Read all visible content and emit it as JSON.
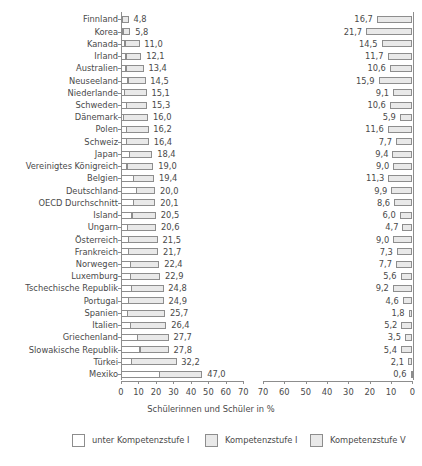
{
  "chart_data": {
    "type": "bar",
    "title": "",
    "subtitle": "",
    "xlabel": "Schülerinnen und Schüler in %",
    "ylabel": "",
    "orientation": "horizontal",
    "panels": [
      {
        "name": "left",
        "direction": "ltr",
        "axis_range": [
          0,
          70
        ],
        "ticks": [
          0,
          10,
          20,
          30,
          40,
          50,
          60,
          70
        ],
        "stacked": true,
        "series_names": [
          "unter Kompetenzstufe I",
          "Kompetenzstufe I"
        ]
      },
      {
        "name": "right",
        "direction": "rtl",
        "axis_range": [
          0,
          70
        ],
        "ticks": [
          70,
          60,
          50,
          40,
          30,
          20,
          10,
          0
        ],
        "stacked": false,
        "series_names": [
          "Kompetenzstufe V"
        ]
      }
    ],
    "grid": false,
    "legend_position": "bottom",
    "categories": [
      "Finnland",
      "Korea",
      "Kanada",
      "Irland",
      "Australien",
      "Neuseeland",
      "Niederlande",
      "Schweden",
      "Dänemark",
      "Polen",
      "Schweiz",
      "Japan",
      "Vereinigtes Königreich",
      "Belgien",
      "Deutschland",
      "OECD Durchschnitt",
      "Island",
      "Ungarn",
      "Österreich",
      "Frankreich",
      "Norwegen",
      "Luxemburg",
      "Tschechische Republik",
      "Portugal",
      "Spanien",
      "Italien",
      "Griechenland",
      "Slowakische Republik",
      "Türkei",
      "Mexiko"
    ],
    "series": [
      {
        "name": "unter Kompetenzstufe I",
        "values": [
          1.1,
          1.4,
          2.5,
          3.1,
          3.0,
          4.2,
          2.1,
          3.3,
          1.6,
          3.5,
          3.5,
          5.2,
          3.6,
          7.3,
          9.2,
          7.5,
          6.5,
          3.8,
          4.6,
          4.5,
          5.5,
          5.5,
          6.2,
          4.5,
          4.1,
          5.5,
          9.7,
          11.1,
          6.2,
          22.1
        ]
      },
      {
        "name": "Kompetenzstufe I",
        "values": [
          3.7,
          4.4,
          8.5,
          9.0,
          10.4,
          10.3,
          13.0,
          12.0,
          14.4,
          12.7,
          12.9,
          13.2,
          15.4,
          12.1,
          10.8,
          12.6,
          14.0,
          16.8,
          16.9,
          17.2,
          16.9,
          17.4,
          18.6,
          20.4,
          21.6,
          20.9,
          18.0,
          16.7,
          26.0,
          24.9
        ]
      }
    ],
    "left_totals": [
      4.8,
      5.8,
      11.0,
      12.1,
      13.4,
      14.5,
      15.1,
      15.3,
      16.0,
      16.2,
      16.4,
      18.4,
      19.0,
      19.4,
      20.0,
      20.1,
      20.5,
      20.6,
      21.5,
      21.7,
      22.4,
      22.9,
      24.8,
      24.9,
      25.7,
      26.4,
      27.7,
      27.8,
      32.2,
      47.0
    ],
    "left_total_labels": [
      "4,8",
      "5,8",
      "11,0",
      "12,1",
      "13,4",
      "14,5",
      "15,1",
      "15,3",
      "16,0",
      "16,2",
      "16,4",
      "18,4",
      "19,0",
      "19,4",
      "20,0",
      "20,1",
      "20,5",
      "20,6",
      "21,5",
      "21,7",
      "22,4",
      "22,9",
      "24,8",
      "24,9",
      "25,7",
      "26,4",
      "27,7",
      "27,8",
      "32,2",
      "47,0"
    ],
    "right_values": [
      16.7,
      21.7,
      14.5,
      11.7,
      10.6,
      15.9,
      9.1,
      10.6,
      5.9,
      11.6,
      7.7,
      9.4,
      9.0,
      11.3,
      9.9,
      8.6,
      6.0,
      4.7,
      9.0,
      7.3,
      7.7,
      5.6,
      9.2,
      4.6,
      1.8,
      5.2,
      3.5,
      5.4,
      2.1,
      0.6
    ],
    "right_value_labels": [
      "16,7",
      "21,7",
      "14,5",
      "11,7",
      "10,6",
      "15,9",
      "9,1",
      "10,6",
      "5,9",
      "11,6",
      "7,7",
      "9,4",
      "9,0",
      "11,3",
      "9,9",
      "8,6",
      "6,0",
      "4,7",
      "9,0",
      "7,3",
      "7,7",
      "5,6",
      "9,2",
      "4,6",
      "1,8",
      "5,2",
      "3,5",
      "5,4",
      "2,1",
      "0,6"
    ],
    "left_tick_labels": [
      "0",
      "10",
      "20",
      "30",
      "40",
      "50",
      "60",
      "70"
    ],
    "right_tick_labels": [
      "70",
      "60",
      "50",
      "40",
      "30",
      "20",
      "10",
      "0"
    ],
    "legend": [
      {
        "label": "unter Kompetenzstufe I",
        "color": "#ffffff"
      },
      {
        "label": "Kompetenzstufe I",
        "color": "#e9e9e9"
      },
      {
        "label": "Kompetenzstufe V",
        "color": "#e9e9e9"
      }
    ],
    "colors": {
      "fill_light": "#e9e9e9",
      "fill_white": "#ffffff",
      "stroke": "#8d8d8d",
      "text": "#4a4a4a"
    }
  }
}
